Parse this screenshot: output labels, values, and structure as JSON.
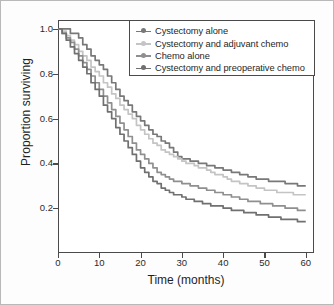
{
  "chart_data": {
    "type": "line",
    "title": "",
    "xlabel": "Time (months)",
    "ylabel": "Proportion surviving",
    "xlim": [
      0,
      62
    ],
    "ylim": [
      0.0,
      1.04
    ],
    "grid": false,
    "legend_position": "top-right",
    "x_ticks": [
      0,
      10,
      20,
      30,
      40,
      50,
      60
    ],
    "x_tick_labels": [
      "0",
      "10",
      "20",
      "30",
      "40",
      "50",
      "60"
    ],
    "y_ticks": [
      0.2,
      0.4,
      0.6,
      0.8,
      1.0
    ],
    "y_tick_labels": [
      "0.2",
      "0.4",
      "0.6",
      "0.8",
      "1.0"
    ],
    "series": [
      {
        "name": "Cystectomy alone",
        "color": "#787878",
        "marker": "circle-line",
        "final_value": 0.3,
        "x": [
          0,
          1,
          2,
          3,
          4,
          5,
          6,
          7,
          8,
          9,
          10,
          11,
          12,
          13,
          14,
          15,
          16,
          17,
          18,
          19,
          20,
          21,
          22,
          23,
          24,
          25,
          26,
          27,
          28,
          29,
          30,
          31,
          32,
          33,
          34,
          35,
          36,
          37,
          38,
          39,
          40,
          41,
          42,
          43,
          44,
          45,
          46,
          47,
          48,
          49,
          50,
          51,
          52,
          53,
          54,
          55,
          56,
          57,
          58,
          59,
          60
        ],
        "values": [
          1.0,
          1.0,
          1.0,
          0.98,
          0.98,
          0.96,
          0.93,
          0.91,
          0.88,
          0.86,
          0.84,
          0.82,
          0.79,
          0.76,
          0.73,
          0.7,
          0.68,
          0.66,
          0.63,
          0.61,
          0.59,
          0.57,
          0.55,
          0.53,
          0.52,
          0.5,
          0.49,
          0.47,
          0.45,
          0.43,
          0.42,
          0.42,
          0.41,
          0.41,
          0.4,
          0.4,
          0.39,
          0.39,
          0.38,
          0.38,
          0.37,
          0.37,
          0.36,
          0.36,
          0.35,
          0.35,
          0.34,
          0.34,
          0.33,
          0.33,
          0.33,
          0.32,
          0.32,
          0.32,
          0.32,
          0.31,
          0.31,
          0.31,
          0.3,
          0.3,
          0.3
        ]
      },
      {
        "name": "Cystectomy and adjuvant chemo",
        "color": "#c4c4c4",
        "marker": "circle-line",
        "final_value": 0.26,
        "x": [
          0,
          1,
          2,
          3,
          4,
          5,
          6,
          7,
          8,
          9,
          10,
          11,
          12,
          13,
          14,
          15,
          16,
          17,
          18,
          19,
          20,
          21,
          22,
          23,
          24,
          25,
          26,
          27,
          28,
          29,
          30,
          31,
          32,
          33,
          34,
          35,
          36,
          37,
          38,
          39,
          40,
          41,
          42,
          43,
          44,
          45,
          46,
          47,
          48,
          49,
          50,
          51,
          52,
          53,
          54,
          55,
          56,
          57,
          58,
          59,
          60
        ],
        "values": [
          1.0,
          0.99,
          0.97,
          0.95,
          0.93,
          0.9,
          0.88,
          0.86,
          0.83,
          0.81,
          0.79,
          0.76,
          0.74,
          0.71,
          0.69,
          0.66,
          0.64,
          0.62,
          0.6,
          0.57,
          0.55,
          0.53,
          0.51,
          0.49,
          0.48,
          0.46,
          0.45,
          0.44,
          0.43,
          0.42,
          0.41,
          0.4,
          0.4,
          0.39,
          0.38,
          0.38,
          0.37,
          0.36,
          0.35,
          0.35,
          0.34,
          0.33,
          0.32,
          0.32,
          0.31,
          0.31,
          0.3,
          0.3,
          0.29,
          0.29,
          0.28,
          0.28,
          0.28,
          0.27,
          0.27,
          0.27,
          0.27,
          0.26,
          0.26,
          0.26,
          0.26
        ]
      },
      {
        "name": "Chemo alone",
        "color": "#8f8f8f",
        "marker": "circle-line",
        "final_value": 0.19,
        "x": [
          0,
          1,
          2,
          3,
          4,
          5,
          6,
          7,
          8,
          9,
          10,
          11,
          12,
          13,
          14,
          15,
          16,
          17,
          18,
          19,
          20,
          21,
          22,
          23,
          24,
          25,
          26,
          27,
          28,
          29,
          30,
          31,
          32,
          33,
          34,
          35,
          36,
          37,
          38,
          39,
          40,
          41,
          42,
          43,
          44,
          45,
          46,
          47,
          48,
          49,
          50,
          51,
          52,
          53,
          54,
          55,
          56,
          57,
          58,
          59,
          60
        ],
        "values": [
          1.0,
          0.98,
          0.96,
          0.94,
          0.91,
          0.88,
          0.85,
          0.82,
          0.79,
          0.76,
          0.73,
          0.7,
          0.67,
          0.64,
          0.61,
          0.58,
          0.55,
          0.52,
          0.49,
          0.46,
          0.44,
          0.42,
          0.4,
          0.38,
          0.36,
          0.35,
          0.34,
          0.33,
          0.32,
          0.32,
          0.31,
          0.31,
          0.3,
          0.3,
          0.29,
          0.29,
          0.28,
          0.28,
          0.27,
          0.27,
          0.26,
          0.26,
          0.25,
          0.25,
          0.24,
          0.24,
          0.23,
          0.23,
          0.23,
          0.22,
          0.22,
          0.22,
          0.21,
          0.21,
          0.21,
          0.2,
          0.2,
          0.2,
          0.19,
          0.19,
          0.19
        ]
      },
      {
        "name": "Cystectomy and preoperative chemo",
        "color": "#707070",
        "marker": "circle-line",
        "final_value": 0.14,
        "x": [
          0,
          1,
          2,
          3,
          4,
          5,
          6,
          7,
          8,
          9,
          10,
          11,
          12,
          13,
          14,
          15,
          16,
          17,
          18,
          19,
          20,
          21,
          22,
          23,
          24,
          25,
          26,
          27,
          28,
          29,
          30,
          31,
          32,
          33,
          34,
          35,
          36,
          37,
          38,
          39,
          40,
          41,
          42,
          43,
          44,
          45,
          46,
          47,
          48,
          49,
          50,
          51,
          52,
          53,
          54,
          55,
          56,
          57,
          58,
          59,
          60
        ],
        "values": [
          1.0,
          0.98,
          0.95,
          0.92,
          0.89,
          0.86,
          0.83,
          0.8,
          0.76,
          0.73,
          0.7,
          0.66,
          0.63,
          0.6,
          0.56,
          0.53,
          0.5,
          0.47,
          0.44,
          0.41,
          0.38,
          0.36,
          0.34,
          0.32,
          0.31,
          0.29,
          0.28,
          0.27,
          0.26,
          0.26,
          0.25,
          0.24,
          0.24,
          0.23,
          0.23,
          0.22,
          0.22,
          0.21,
          0.21,
          0.21,
          0.2,
          0.2,
          0.19,
          0.19,
          0.19,
          0.18,
          0.18,
          0.18,
          0.17,
          0.17,
          0.17,
          0.16,
          0.16,
          0.16,
          0.15,
          0.15,
          0.15,
          0.15,
          0.14,
          0.14,
          0.14
        ]
      }
    ]
  }
}
